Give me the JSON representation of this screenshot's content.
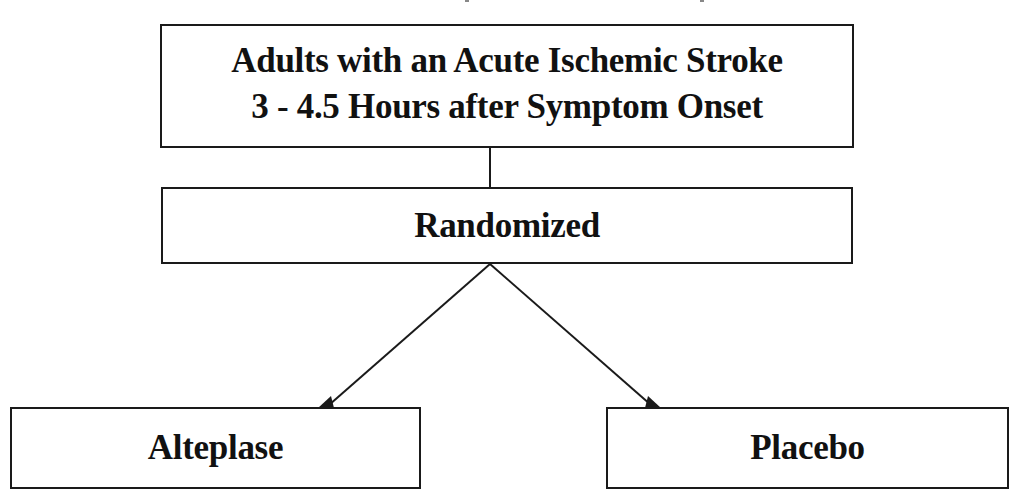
{
  "diagram": {
    "type": "flowchart",
    "nodes": {
      "population": {
        "line1": "Adults with an Acute Ischemic Stroke",
        "line2": "3 - 4.5 Hours after Symptom Onset"
      },
      "randomized": {
        "label": "Randomized"
      },
      "alteplase": {
        "label": "Alteplase"
      },
      "placebo": {
        "label": "Placebo"
      }
    },
    "edges": [
      {
        "from": "population",
        "to": "randomized",
        "style": "line"
      },
      {
        "from": "randomized",
        "to": "alteplase",
        "style": "arrow"
      },
      {
        "from": "randomized",
        "to": "placebo",
        "style": "arrow"
      }
    ],
    "colors": {
      "stroke": "#1a1a1a",
      "text": "#111111",
      "background": "#ffffff"
    }
  }
}
